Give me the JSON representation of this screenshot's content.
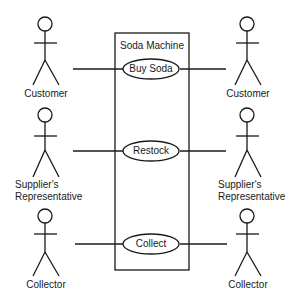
{
  "diagram": {
    "type": "uml-use-case",
    "system": {
      "label": "Soda Machine"
    },
    "use_cases": [
      {
        "label": "Buy Soda"
      },
      {
        "label": "Restock"
      },
      {
        "label": "Collect"
      }
    ],
    "actors_left": [
      {
        "line1": "Customer",
        "line2": ""
      },
      {
        "line1": "Supplier's",
        "line2": "Representative"
      },
      {
        "line1": "Collector",
        "line2": ""
      }
    ],
    "actors_right": [
      {
        "line1": "Customer",
        "line2": ""
      },
      {
        "line1": "Supplier's",
        "line2": "Representative"
      },
      {
        "line1": "Collector",
        "line2": ""
      }
    ],
    "colors": {
      "stroke": "#1a1a1a",
      "background": "#ffffff"
    }
  }
}
